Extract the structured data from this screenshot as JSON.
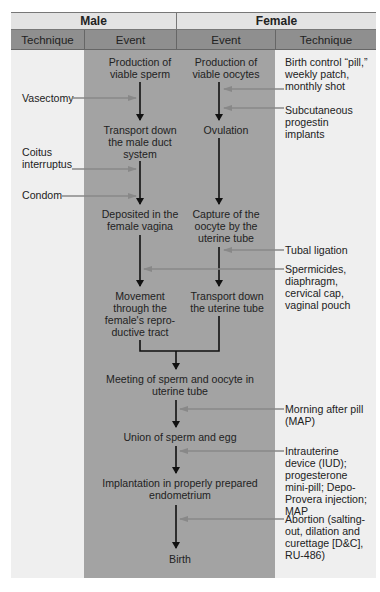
{
  "headers": {
    "male": "Male",
    "female": "Female"
  },
  "subheaders": {
    "male_technique": "Technique",
    "male_event": "Event",
    "female_event": "Event",
    "female_technique": "Technique"
  },
  "male_events": [
    "Production of viable sperm",
    "Transport down the male duct system",
    "Deposited in the female vagina",
    "Movement through the female's repro-ductive tract"
  ],
  "female_events": [
    "Production of viable oocytes",
    "Ovulation",
    "Capture of the oocyte by the uterine tube",
    "Transport down the uterine tube"
  ],
  "shared_events": [
    "Meeting of sperm and oocyte in uterine tube",
    "Union of sperm and egg",
    "Implantation in properly prepared endometrium",
    "Birth"
  ],
  "male_techniques": [
    "Vasectomy",
    "Coitus interruptus",
    "Condom"
  ],
  "female_techniques": [
    "Birth control “pill,” weekly patch, monthly shot",
    "Subcutaneous progestin implants",
    "Tubal ligation",
    "Spermicides, diaphragm, cervical cap, vaginal pouch",
    "Morning after pill (MAP)",
    "Intrauterine device (IUD); progesterone mini-pill; Depo-Provera injection; MAP",
    "Abortion (salting-out, dilation and curettage [D&C], RU-486)"
  ],
  "colors": {
    "panel": "#efefef",
    "band": "#a3a3a3",
    "header": "#e3e3e3",
    "subheader": "#8f8f8f",
    "arrow_dark": "#111111",
    "arrow_grey": "#777777"
  }
}
